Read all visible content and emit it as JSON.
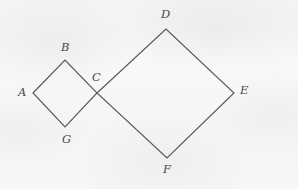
{
  "figure": {
    "caption": "Two squares sharing a common vertex C",
    "background_color": "#f7f7f7",
    "stroke_color": "#54545a",
    "label_color": "#4a4a4a",
    "width": 298,
    "height": 189
  },
  "labels": {
    "A": "A",
    "B": "B",
    "C": "C",
    "D": "D",
    "E": "E",
    "F": "F",
    "G": "G"
  },
  "bleed_through": {
    "line1": "",
    "line2": "",
    "line3": ""
  },
  "chart_data": {
    "type": "diagram",
    "points": {
      "A": [
        33,
        93
      ],
      "B": [
        65,
        60
      ],
      "C": [
        97,
        93
      ],
      "D": [
        166,
        29
      ],
      "E": [
        234,
        93
      ],
      "F": [
        167,
        158
      ],
      "G": [
        65,
        127
      ]
    },
    "label_positions": {
      "A": [
        18,
        92
      ],
      "B": [
        61,
        47
      ],
      "C": [
        92,
        77
      ],
      "D": [
        161,
        14
      ],
      "E": [
        240,
        90
      ],
      "F": [
        163,
        169
      ],
      "G": [
        62,
        139
      ]
    },
    "shapes": [
      {
        "name": "small-square-ABCG",
        "vertices": [
          "A",
          "B",
          "C",
          "G"
        ],
        "closed": true
      },
      {
        "name": "large-square-CDEF",
        "vertices": [
          "C",
          "D",
          "E",
          "F"
        ],
        "closed": true
      }
    ],
    "shared_vertex": "C",
    "stroke_width": 1.1,
    "legend": "none",
    "grid": false
  }
}
